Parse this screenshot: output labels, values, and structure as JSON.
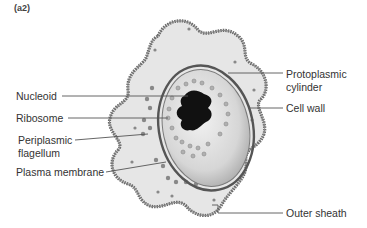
{
  "panel_label": "(a2)",
  "diagram": {
    "labels_left": [
      {
        "text": "Nucleoid",
        "id": "nucleoid"
      },
      {
        "text": "Ribosome",
        "id": "ribosome"
      },
      {
        "text": "Periplasmic",
        "id": "periplasmic-1"
      },
      {
        "text": "flagellum",
        "id": "periplasmic-2"
      },
      {
        "text": "Plasma membrane",
        "id": "plasma-membrane"
      }
    ],
    "labels_right": [
      {
        "text": "Protoplasmic",
        "id": "protoplasmic-1"
      },
      {
        "text": "cylinder",
        "id": "protoplasmic-2"
      },
      {
        "text": "Cell wall",
        "id": "cell-wall"
      },
      {
        "text": "Outer sheath",
        "id": "outer-sheath"
      }
    ]
  },
  "colors": {
    "sheath_fill": "#e6e6e6",
    "sheath_edge": "#6a6a6a",
    "cylinder_fill": "#d4d4d4",
    "nucleoid": "#111111",
    "leader": "#555555"
  }
}
